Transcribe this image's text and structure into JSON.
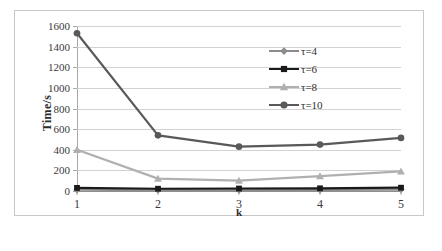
{
  "chart_data": {
    "type": "line",
    "title": "",
    "xlabel": "k",
    "ylabel": "Time/s",
    "x": [
      1,
      2,
      3,
      4,
      5
    ],
    "xticklabels": [
      "1",
      "2",
      "3",
      "4",
      "5"
    ],
    "yticklabels": [
      "0",
      "200",
      "400",
      "600",
      "800",
      "1000",
      "1200",
      "1400",
      "1600"
    ],
    "yticks": [
      0,
      200,
      400,
      600,
      800,
      1000,
      1200,
      1400,
      1600
    ],
    "ylim": [
      0,
      1600
    ],
    "xlim": [
      1,
      5
    ],
    "grid": "horizontal",
    "legend_position": "upper-right-inside",
    "series": [
      {
        "name": "τ=4",
        "values": [
          12,
          8,
          8,
          10,
          14
        ],
        "color": "#8c8c8c",
        "marker": "diamond"
      },
      {
        "name": "τ=6",
        "values": [
          30,
          22,
          24,
          26,
          32
        ],
        "color": "#1a1a1a",
        "marker": "square"
      },
      {
        "name": "τ=8",
        "values": [
          400,
          120,
          100,
          145,
          190
        ],
        "color": "#b0b0b0",
        "marker": "triangle"
      },
      {
        "name": "τ=10",
        "values": [
          1530,
          540,
          430,
          450,
          515
        ],
        "color": "#595959",
        "marker": "circle"
      }
    ]
  },
  "axes": {
    "y_title": "Time/s",
    "x_title": "k"
  },
  "legend": {
    "items": [
      {
        "label": "τ=4"
      },
      {
        "label": "τ=6"
      },
      {
        "label": "τ=8"
      },
      {
        "label": "τ=10"
      }
    ]
  },
  "colors": {
    "frame": "#c8c8c8",
    "gridline": "#d2d2d2",
    "axis": "#a8a8a8",
    "text": "#2e2e2e",
    "background": "#ffffff"
  }
}
